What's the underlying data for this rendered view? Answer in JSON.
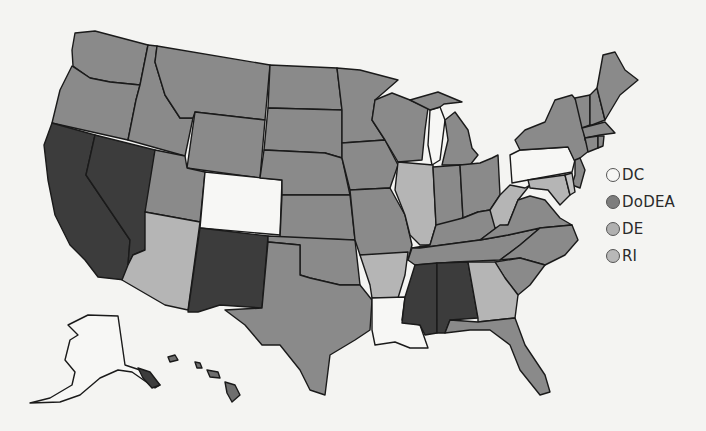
{
  "map": {
    "title": "",
    "colors": {
      "white": "#f7f7f5",
      "medium": "#8a8a8a",
      "light": "#b5b5b5",
      "dark": "#3c3c3c",
      "border": "#1a1a1a"
    },
    "state_categories": {
      "white": [
        "CO",
        "PA",
        "LA",
        "AK",
        "Lake Michigan"
      ],
      "dark": [
        "CA",
        "NV",
        "NM",
        "MS",
        "AL"
      ],
      "light": [
        "AZ",
        "IL",
        "AR",
        "GA",
        "WV",
        "MD",
        "DE"
      ],
      "medium": [
        "WA",
        "OR",
        "ID",
        "MT",
        "WY",
        "UT",
        "ND",
        "SD",
        "NE",
        "KS",
        "OK",
        "TX",
        "MN",
        "IA",
        "MO",
        "WI",
        "MI",
        "IN",
        "OH",
        "KY",
        "TN",
        "VA",
        "NC",
        "SC",
        "FL",
        "NY",
        "VT",
        "NH",
        "ME",
        "MA",
        "CT",
        "RI",
        "NJ",
        "HI"
      ]
    }
  },
  "legend": {
    "items": [
      {
        "label": "DC",
        "color": "#f7f7f5"
      },
      {
        "label": "DoDEA",
        "color": "#7d7d7d"
      },
      {
        "label": "DE",
        "color": "#b0b0b0"
      },
      {
        "label": "RI",
        "color": "#b8b8b8"
      }
    ]
  }
}
